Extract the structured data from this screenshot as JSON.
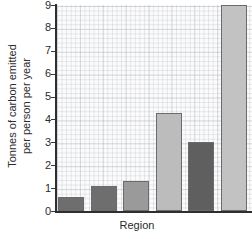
{
  "chart_data": {
    "type": "bar",
    "title": "",
    "subtitle": "",
    "xlabel": "Region",
    "ylabel_line1": "Tonnes of carbon emitted",
    "ylabel_line2": "per person per year",
    "ylabel": "Tonnes of carbon emitted per person per year",
    "categories": [
      "",
      "",
      "",
      "",
      "",
      ""
    ],
    "values": [
      0.6,
      1.1,
      1.3,
      4.3,
      3.0,
      9.0
    ],
    "bar_colors": [
      "#6e6e6e",
      "#6e6e6e",
      "#9a9a9a",
      "#bcbcbc",
      "#5f5f5f",
      "#c2c2c2"
    ],
    "bar_border_color": "#6b6b6b",
    "ylim": [
      0,
      9
    ],
    "yticks": [
      0,
      1,
      2,
      3,
      4,
      5,
      6,
      7,
      8,
      9
    ],
    "ytick_labels": [
      "0",
      "1",
      "2",
      "3",
      "4",
      "5",
      "6",
      "7",
      "8",
      "9"
    ],
    "xticks": [],
    "xtick_labels": [],
    "grid": true,
    "grid_style": "graph-paper minor 0.2 major 1.0",
    "legend": false,
    "legend_position": "none",
    "plot_background": "#fbfbfb",
    "axis_color": "#2f2f2f",
    "text_color": "#2b2b2b"
  }
}
